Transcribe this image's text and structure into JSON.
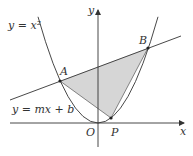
{
  "diagram": {
    "title": "",
    "curves": {
      "parabola_label": "y = x²",
      "line_label": "y = mx + b"
    },
    "axes": {
      "x_label": "x",
      "y_label": "y",
      "origin_label": "O"
    },
    "points": {
      "A": "A",
      "B": "B",
      "P": "P"
    },
    "colors": {
      "stroke": "#333333",
      "shaded_region": "#d6d6d6",
      "background": "#ffffff"
    },
    "shaded_region": "triangle APB"
  }
}
